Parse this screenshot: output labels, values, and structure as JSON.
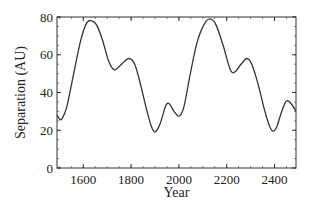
{
  "chart_data": {
    "type": "line",
    "title": "",
    "xlabel": "Year",
    "ylabel": "Separation (AU)",
    "xlim": [
      1490,
      2490
    ],
    "ylim": [
      0,
      80
    ],
    "xticks": [
      1600,
      1800,
      2000,
      2200,
      2400
    ],
    "yticks": [
      0,
      20,
      40,
      60,
      80
    ],
    "grid": false,
    "legend": null,
    "series": [
      {
        "name": "Separation",
        "x": [
          1490,
          1500,
          1510,
          1530,
          1560,
          1590,
          1615,
          1635,
          1655,
          1680,
          1705,
          1730,
          1760,
          1790,
          1815,
          1840,
          1865,
          1885,
          1900,
          1920,
          1945,
          1960,
          1980,
          2000,
          2020,
          2045,
          2075,
          2105,
          2130,
          2155,
          2185,
          2215,
          2235,
          2260,
          2285,
          2305,
          2330,
          2360,
          2380,
          2395,
          2410,
          2430,
          2450,
          2470,
          2490
        ],
        "values": [
          28,
          26,
          26,
          32,
          50,
          68,
          77,
          78,
          76,
          68,
          57,
          52,
          55,
          58,
          55,
          44,
          31,
          22,
          19,
          23,
          33,
          34,
          30,
          27.5,
          32,
          48,
          66,
          76,
          79,
          76,
          65,
          52,
          51,
          55,
          58,
          55,
          45,
          30,
          22,
          19.5,
          22,
          30,
          35.5,
          34,
          30
        ]
      }
    ],
    "colors": {
      "line": "#333333",
      "axis": "#333333"
    }
  }
}
